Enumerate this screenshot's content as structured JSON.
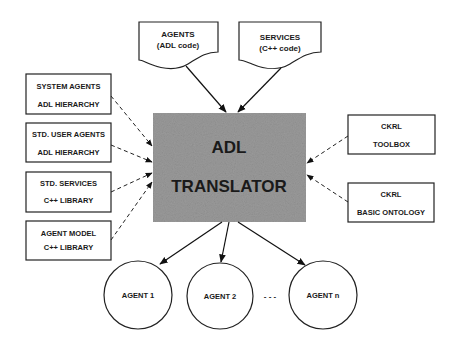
{
  "diagram": {
    "translator": {
      "line1": "ADL",
      "line2": "TRANSLATOR",
      "fill": "#9a9a9a"
    },
    "inputs_top": [
      {
        "line1": "AGENTS",
        "line2": "(ADL code)"
      },
      {
        "line1": "SERVICES",
        "line2": "(C++ code)"
      }
    ],
    "inputs_left": [
      {
        "line1": "SYSTEM AGENTS",
        "line2": "ADL HIERARCHY"
      },
      {
        "line1": "STD. USER AGENTS",
        "line2": "ADL HIERARCHY"
      },
      {
        "line1": "STD. SERVICES",
        "line2": "C++ LIBRARY"
      },
      {
        "line1": "AGENT MODEL",
        "line2": "C++ LIBRARY"
      }
    ],
    "inputs_right": [
      {
        "line1": "CKRL",
        "line2": "TOOLBOX"
      },
      {
        "line1": "CKRL",
        "line2": "BASIC ONTOLOGY"
      }
    ],
    "outputs": [
      {
        "label": "AGENT 1"
      },
      {
        "label": "AGENT 2"
      },
      {
        "label": "AGENT n"
      }
    ],
    "ellipsis": "- - -"
  }
}
